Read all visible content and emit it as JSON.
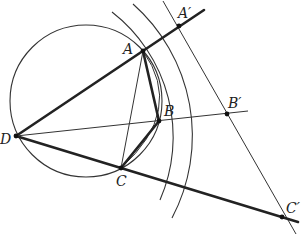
{
  "figure": {
    "labels": {
      "A": "A",
      "B": "B",
      "C": "C",
      "D": "D",
      "A_prime": "A′",
      "B_prime": "B′",
      "C_prime": "C′"
    },
    "points": {
      "A": [
        143,
        51
      ],
      "B": [
        159,
        121
      ],
      "C": [
        121,
        168
      ],
      "D": [
        16,
        136
      ],
      "A_prime": [
        179,
        26
      ],
      "B_prime": [
        227,
        114
      ],
      "C_prime": [
        282,
        217
      ]
    },
    "colors": {
      "stroke": "#222222",
      "background": "#ffffff"
    }
  }
}
